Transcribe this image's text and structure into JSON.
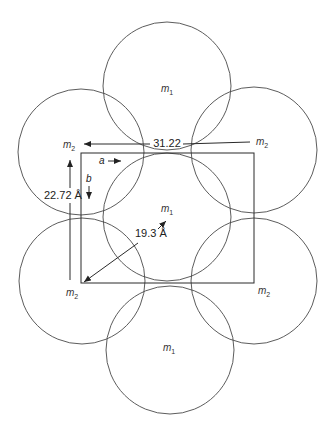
{
  "diagram": {
    "molecules": [
      {
        "id": "m1-top",
        "symbol": "m",
        "subscript": "1"
      },
      {
        "id": "m2-upper-left",
        "symbol": "m",
        "subscript": "2"
      },
      {
        "id": "m2-upper-right",
        "symbol": "m",
        "subscript": "2"
      },
      {
        "id": "m1-center",
        "symbol": "m",
        "subscript": "1"
      },
      {
        "id": "m2-lower-left",
        "symbol": "m",
        "subscript": "2"
      },
      {
        "id": "m2-lower-right",
        "symbol": "m",
        "subscript": "2"
      },
      {
        "id": "m1-bottom",
        "symbol": "m",
        "subscript": "1"
      }
    ],
    "dimensions": {
      "a_length": "31.22",
      "b_length": "22.72 Å",
      "diagonal": "19.3 Å"
    },
    "axes": {
      "a_label": "a",
      "b_label": "b"
    }
  }
}
